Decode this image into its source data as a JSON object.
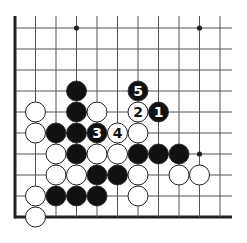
{
  "board": {
    "title": "Go problem diagram",
    "colors": {
      "background": "#ffffff",
      "line": "#555555",
      "edge": "#222222",
      "black": "#111111",
      "white": "#ffffff",
      "star": "#222222"
    },
    "columns": 11,
    "rows": 10,
    "origin": {
      "x": 15,
      "y": 28
    },
    "step": {
      "x": 20.5,
      "y": 21
    },
    "left_edge": true,
    "bottom_edge": true,
    "star_points": [
      {
        "c": 3,
        "r": 0
      },
      {
        "c": 9,
        "r": 0
      },
      {
        "c": 9,
        "r": 6
      }
    ],
    "stones": [
      {
        "c": 3,
        "r": 3,
        "color": "black"
      },
      {
        "c": 6,
        "r": 3,
        "color": "black",
        "label": "5"
      },
      {
        "c": 1,
        "r": 4,
        "color": "white"
      },
      {
        "c": 3,
        "r": 4,
        "color": "black"
      },
      {
        "c": 4,
        "r": 4,
        "color": "white"
      },
      {
        "c": 6,
        "r": 4,
        "color": "white",
        "label": "2"
      },
      {
        "c": 7,
        "r": 4,
        "color": "black",
        "label": "1"
      },
      {
        "c": 1,
        "r": 5,
        "color": "white"
      },
      {
        "c": 2,
        "r": 5,
        "color": "black"
      },
      {
        "c": 3,
        "r": 5,
        "color": "black"
      },
      {
        "c": 4,
        "r": 5,
        "color": "black",
        "label": "3"
      },
      {
        "c": 5,
        "r": 5,
        "color": "white",
        "label": "4"
      },
      {
        "c": 6,
        "r": 5,
        "color": "white"
      },
      {
        "c": 2,
        "r": 6,
        "color": "white"
      },
      {
        "c": 3,
        "r": 6,
        "color": "black"
      },
      {
        "c": 4,
        "r": 6,
        "color": "white"
      },
      {
        "c": 5,
        "r": 6,
        "color": "white"
      },
      {
        "c": 6,
        "r": 6,
        "color": "black"
      },
      {
        "c": 7,
        "r": 6,
        "color": "black"
      },
      {
        "c": 8,
        "r": 6,
        "color": "black"
      },
      {
        "c": 2,
        "r": 7,
        "color": "white"
      },
      {
        "c": 3,
        "r": 7,
        "color": "white"
      },
      {
        "c": 4,
        "r": 7,
        "color": "black"
      },
      {
        "c": 5,
        "r": 7,
        "color": "black"
      },
      {
        "c": 6,
        "r": 7,
        "color": "white"
      },
      {
        "c": 8,
        "r": 7,
        "color": "white"
      },
      {
        "c": 9,
        "r": 7,
        "color": "white"
      },
      {
        "c": 1,
        "r": 8,
        "color": "white"
      },
      {
        "c": 2,
        "r": 8,
        "color": "black"
      },
      {
        "c": 3,
        "r": 8,
        "color": "black"
      },
      {
        "c": 4,
        "r": 8,
        "color": "black"
      },
      {
        "c": 6,
        "r": 8,
        "color": "white"
      },
      {
        "c": 1,
        "r": 9,
        "color": "white"
      }
    ]
  }
}
